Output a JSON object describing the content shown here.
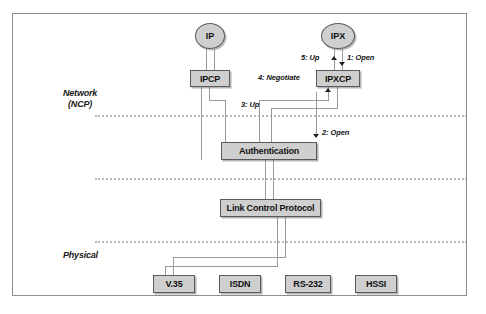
{
  "figure": {
    "layers": [
      {
        "id": "network",
        "label_line1": "Network",
        "label_line2": "(NCP)"
      },
      {
        "id": "physical",
        "label_line1": "Physical",
        "label_line2": ""
      }
    ],
    "nodes": {
      "ip": "IP",
      "ipx": "IPX",
      "ipcp": "IPCP",
      "ipxcp": "IPXCP",
      "authentication": "Authentication",
      "lcp": "Link Control Protocol"
    },
    "physical_interfaces": [
      "V.35",
      "ISDN",
      "RS-232",
      "HSSI"
    ],
    "steps": [
      {
        "num": "1",
        "label": "1: Open"
      },
      {
        "num": "2",
        "label": "2: Open"
      },
      {
        "num": "3",
        "label": "3: Up"
      },
      {
        "num": "4",
        "label": "4: Negotiate"
      },
      {
        "num": "5",
        "label": "5: Up"
      }
    ],
    "colors": {
      "box_fill": "#cfcfcf",
      "box_border": "#5a5a5a",
      "line": "#9a9a9a",
      "divider": "#b9b9b9",
      "frame": "#8d8d8d"
    }
  }
}
